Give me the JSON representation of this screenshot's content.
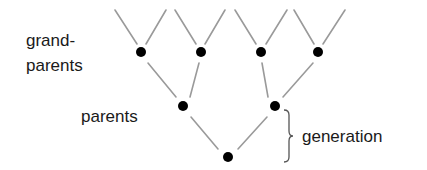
{
  "diagram": {
    "labels": {
      "grandparents_line1": "grand-",
      "grandparents_line2": "parents",
      "parents": "parents",
      "generation": "generation"
    },
    "colors": {
      "dot": "#000000",
      "line": "#9a9a9a",
      "text": "#1a1a1a",
      "background": "#ffffff"
    },
    "nodes": [
      {
        "id": "gp1",
        "level": "grandparents",
        "x": 141,
        "y": 52
      },
      {
        "id": "gp2",
        "level": "grandparents",
        "x": 201,
        "y": 52
      },
      {
        "id": "gp3",
        "level": "grandparents",
        "x": 261,
        "y": 52
      },
      {
        "id": "gp4",
        "level": "grandparents",
        "x": 318,
        "y": 52
      },
      {
        "id": "p1",
        "level": "parents",
        "x": 183,
        "y": 106
      },
      {
        "id": "p2",
        "level": "parents",
        "x": 275,
        "y": 106
      },
      {
        "id": "child",
        "level": "child",
        "x": 228,
        "y": 157
      }
    ],
    "edges": [
      [
        "gp1",
        "p1"
      ],
      [
        "gp2",
        "p1"
      ],
      [
        "gp3",
        "p2"
      ],
      [
        "gp4",
        "p2"
      ],
      [
        "p1",
        "child"
      ],
      [
        "p2",
        "child"
      ]
    ],
    "annotation": {
      "type": "brace",
      "spans": [
        "p2",
        "child"
      ],
      "label": "generation"
    }
  }
}
